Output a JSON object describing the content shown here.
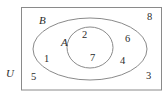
{
  "figure": {
    "type": "venn-diagram",
    "width": 166,
    "height": 104,
    "background_color": "#ffffff",
    "stroke_color": "#8a8a8a",
    "text_color": "#2b2b2b"
  },
  "sets": {
    "universe": {
      "label": "U",
      "shape": "rectangle",
      "position": "outside-bottom-left"
    },
    "outer": {
      "label": "B",
      "shape": "ellipse",
      "position": "upper-left-of-outer-ellipse"
    },
    "inner": {
      "label": "A",
      "shape": "ellipse",
      "position": "left-of-inner-ellipse"
    }
  },
  "regions": [
    {
      "value": "8",
      "region": "inside-U-outside-B",
      "position": "top-right"
    },
    {
      "value": "6",
      "region": "inside-B-outside-A",
      "position": "right-upper"
    },
    {
      "value": "4",
      "region": "inside-B-outside-A",
      "position": "right-lower"
    },
    {
      "value": "3",
      "region": "inside-U-outside-B",
      "position": "bottom-right"
    },
    {
      "value": "1",
      "region": "inside-B-outside-A",
      "position": "left"
    },
    {
      "value": "5",
      "region": "inside-U-outside-B",
      "position": "bottom-left"
    },
    {
      "value": "2",
      "region": "inside-A",
      "position": "upper"
    },
    {
      "value": "7",
      "region": "inside-A",
      "position": "lower"
    }
  ],
  "elements": {
    "label_U": "U",
    "label_B": "B",
    "label_A": "A",
    "num_8": "8",
    "num_6": "6",
    "num_4": "4",
    "num_3": "3",
    "num_1": "1",
    "num_5": "5",
    "num_2": "2",
    "num_7": "7"
  }
}
